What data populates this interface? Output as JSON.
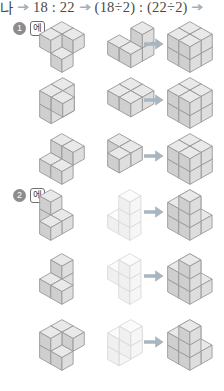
{
  "top_formula": {
    "prefix": "나",
    "ratio1": "18 : 22",
    "ratio2": "(18÷2) : (22÷2)",
    "arrow_glyph": "arrow-right"
  },
  "colors": {
    "cube_top": "#e9e9e9",
    "cube_left": "#cfcfcf",
    "cube_right": "#dedede",
    "cube_outline": "#9a9a9a",
    "cube_faint_top": "#fbfbfb",
    "cube_faint_left": "#f0f0f0",
    "cube_faint_right": "#f6f6f6",
    "cube_faint_outline": "#d8d8d8",
    "arrow": "#a8b6c2",
    "badge_bg": "#8c8c8c",
    "badge_text": "#ffffff",
    "page_bg": "#ffffff"
  },
  "sections": [
    {
      "number": "1",
      "label": "에",
      "rows": [
        {
          "shape_a": "s-notch-4",
          "shape_b": "s-tee-4",
          "result": "cube-2x2x2",
          "arrow": "arrow-right",
          "faint_b": false
        },
        {
          "shape_a": "l-corner-5",
          "shape_b": "flat-2x2",
          "result": "cube-2x2x2",
          "arrow": "arrow-right",
          "faint_b": false
        },
        {
          "shape_a": "step-5",
          "shape_b": "l-tri-3",
          "result": "cube-2x2x2",
          "arrow": "arrow-right",
          "faint_b": false
        }
      ]
    },
    {
      "number": "2",
      "label": "에",
      "rows": [
        {
          "shape_a": "l-corner-4",
          "shape_b": "tall-l-4",
          "result": "stair-8",
          "arrow": "arrow-right",
          "faint_b": true
        },
        {
          "shape_a": "step-4",
          "shape_b": "plus-tower-4",
          "result": "stair-8",
          "arrow": "arrow-right",
          "faint_b": true
        },
        {
          "shape_a": "s-notch-5",
          "shape_b": "tall-step-4",
          "result": "stair-8",
          "arrow": "arrow-right",
          "faint_b": true
        }
      ]
    }
  ]
}
